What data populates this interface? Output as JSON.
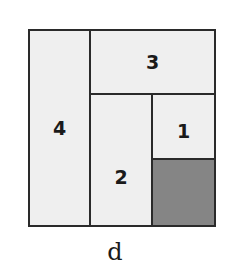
{
  "diagram": {
    "caption": "d",
    "cells": [
      {
        "id": "4",
        "label": "4"
      },
      {
        "id": "3",
        "label": "3"
      },
      {
        "id": "2",
        "label": "2"
      },
      {
        "id": "1",
        "label": "1"
      },
      {
        "id": "shaded",
        "label": ""
      }
    ],
    "colors": {
      "light": "#efefef",
      "shaded": "#858585",
      "border": "#2a2a2a"
    }
  }
}
